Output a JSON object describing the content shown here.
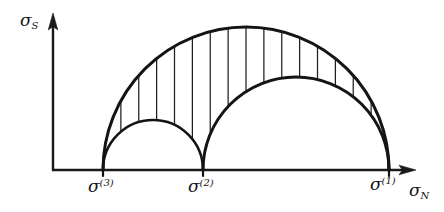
{
  "figure": {
    "background_color": "#ffffff",
    "ink_color": "#141414",
    "width": 444,
    "height": 212
  },
  "axes": {
    "vertical": {
      "name": "shear-stress-axis",
      "label_base": "σ",
      "label_sub": "S",
      "origin": [
        53,
        170
      ],
      "tip": [
        53,
        15
      ],
      "arrow": "up"
    },
    "horizontal": {
      "name": "normal-stress-axis",
      "label_base": "σ",
      "label_sub": "N",
      "origin": [
        53,
        170
      ],
      "tip": [
        415,
        170
      ],
      "arrow": "right"
    }
  },
  "tick_labels": [
    {
      "id": "sigma-3",
      "base": "σ",
      "sup": "(3)",
      "x": 103
    },
    {
      "id": "sigma-2",
      "base": "σ",
      "sup": "(2)",
      "x": 203
    },
    {
      "id": "sigma-1",
      "base": "σ",
      "sup": "(1)",
      "x": 389
    }
  ],
  "chart_data": {
    "type": "line",
    "xlabel": "σ_N",
    "ylabel": "σ_S",
    "grid": false,
    "legend": "none",
    "baseline_y": 170,
    "principal_stresses": {
      "sigma_1_px": 389,
      "sigma_2_px": 203,
      "sigma_3_px": 103
    },
    "circles": [
      {
        "name": "large-circle",
        "spans": [
          "sigma-3",
          "sigma-1"
        ],
        "center_x": 246,
        "radius": 143,
        "peak_y": 27
      },
      {
        "name": "medium-circle",
        "spans": [
          "sigma-2",
          "sigma-1"
        ],
        "center_x": 296,
        "radius": 93,
        "peak_y": 77
      },
      {
        "name": "small-circle",
        "spans": [
          "sigma-3",
          "sigma-2"
        ],
        "center_x": 153,
        "radius": 50,
        "peak_y": 120
      }
    ],
    "hatching": {
      "orientation": "vertical",
      "line_count": 15,
      "region": "between large circle arc and the two inner circle arcs"
    }
  }
}
